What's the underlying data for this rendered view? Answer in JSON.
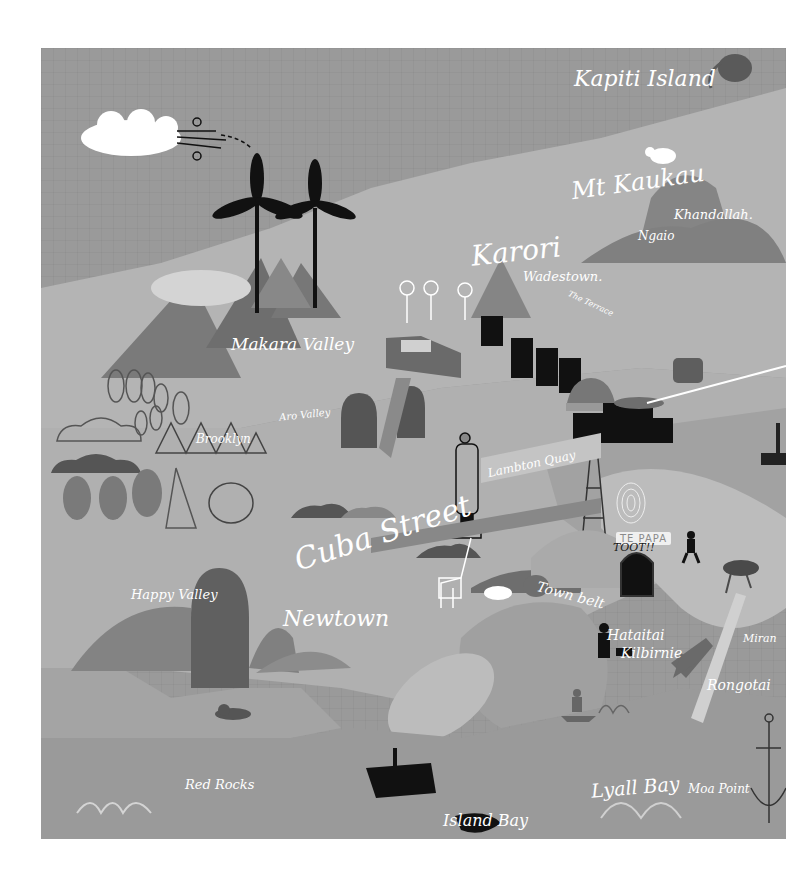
{
  "map": {
    "title": "Illustrated map of Wellington",
    "palette": {
      "sea": "#9a9a9a",
      "land_light": "#b4b4b4",
      "land_mid": "#a6a6a6",
      "hill_dark": "#6e6e6e",
      "hill_mid": "#858585",
      "ink": "#111111",
      "label": "#ffffff"
    },
    "labels": {
      "kapiti_island": "Kapiti Island",
      "mt_kaukau": "Mt Kaukau",
      "khandallah": "Khandallah.",
      "ngaio": "Ngaio",
      "karori": "Karori",
      "wadestown": "Wadestown.",
      "the_terrace": "The Terrace",
      "makara_valley": "Makara Valley",
      "aro_valley": "Aro Valley",
      "brooklyn": "Brooklyn",
      "lambton_quay": "Lambton Quay",
      "harbour": "Harbour",
      "cuba_street": "Cuba Street",
      "te_papa": "TE PAPA",
      "toot": "TOOT!!",
      "town_belt": "Town belt",
      "happy_valley": "Happy Valley",
      "newtown": "Newtown",
      "hataitai": "Hataitai",
      "kilbirnie": "Kilbirnie",
      "miramar": "Miran",
      "rongotai": "Rongotai",
      "red_rocks": "Red Rocks",
      "lyall_bay": "Lyall Bay",
      "moa_point": "Moa Point",
      "island_bay": "Island Bay"
    },
    "icons": [
      "cloud-icon",
      "wind-gust-icon",
      "wind-turbine-icon",
      "kiwi-bird-icon",
      "sheep-icon",
      "flower-icon",
      "office-buildings-icon",
      "beehive-icon",
      "parliament-building-icon",
      "radio-tower-icon",
      "fingerprint-icon",
      "runner-icon",
      "truck-icon",
      "stadium-icon",
      "tunnel-icon",
      "giraffe-icon",
      "rhino-icon",
      "weta-insect-icon",
      "airplane-icon",
      "dog-walker-icon",
      "surfer-icon",
      "wave-icon",
      "anchor-icon",
      "seal-icon",
      "ship-icon",
      "boat-icon",
      "forest-icon"
    ]
  }
}
